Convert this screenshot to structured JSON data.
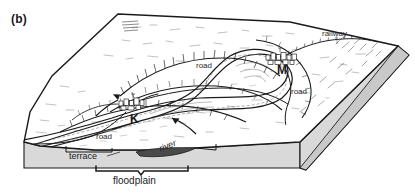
{
  "figure": {
    "panel_letter": "(b)",
    "type": "block-diagram"
  },
  "labels": {
    "railway": "railway",
    "road_north": "road",
    "road_east": "road",
    "road_west": "road",
    "terrace": "terrace",
    "river": "river",
    "floodplain": "floodplain"
  },
  "settlements": [
    {
      "key": "K",
      "label": "K",
      "name": "settlement-k"
    },
    {
      "key": "M",
      "label": "M",
      "name": "settlement-m"
    }
  ],
  "colors": {
    "ink": "#1a1a1a",
    "block_side": "#d9d9d9",
    "block_side_shadow": "#c9c9c9",
    "hatch": "#5a5a5a",
    "paper": "#ffffff",
    "channel_fill": "#4a4a4a"
  }
}
